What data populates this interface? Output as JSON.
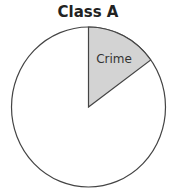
{
  "chart_data": {
    "type": "pie",
    "title": "Class A",
    "slices": [
      {
        "label": "Crime",
        "value": 15,
        "color": "#d3d3d3",
        "labeled": true
      },
      {
        "label": "",
        "value": 85,
        "color": "#ffffff",
        "labeled": false
      }
    ],
    "start_angle_deg": 0,
    "direction": "clockwise",
    "legend": "none"
  }
}
